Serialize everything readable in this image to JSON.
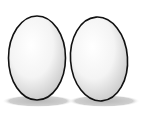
{
  "illustration": {
    "subject": "two eggs",
    "colors": {
      "outline": "#111111",
      "fill_light": "#ffffff",
      "fill_dark": "#c8c8c8",
      "shadow": "#bdbdbd",
      "background": "#ffffff"
    },
    "eggs": [
      {
        "cx": 37,
        "cy": 58,
        "rx": 28.5,
        "ry": 42,
        "rotate": 0
      },
      {
        "cx": 99,
        "cy": 59,
        "rx": 28.5,
        "ry": 42,
        "rotate": -4
      }
    ]
  }
}
